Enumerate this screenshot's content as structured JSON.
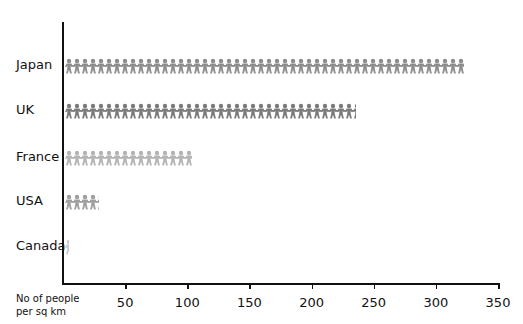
{
  "chart_data": {
    "type": "bar",
    "orientation": "horizontal",
    "style": "pictogram (paper-chain people)",
    "title": "",
    "xlabel": "No of people per sq km",
    "ylabel": "",
    "xlim": [
      0,
      350
    ],
    "x_ticks": [
      50,
      100,
      150,
      200,
      250,
      300,
      350
    ],
    "categories": [
      "Japan",
      "UK",
      "France",
      "USA",
      "Canada"
    ],
    "values": [
      321,
      234,
      102,
      27,
      3
    ],
    "colors": [
      "#8c8c8c",
      "#7a7a7a",
      "#b4b4b4",
      "#9e9e9e",
      "#c8c8c8"
    ],
    "grid": false,
    "legend": null
  },
  "labels": {
    "xlabel_line1": "No of people",
    "xlabel_line2": "per sq km"
  }
}
